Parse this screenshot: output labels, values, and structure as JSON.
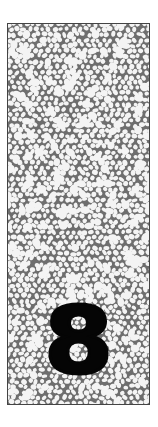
{
  "card": {
    "number": "8",
    "texture": "pebble-cells",
    "colors": {
      "cell_fill": "#f4f4f4",
      "cell_outline": "#6e6e6e",
      "border": "#444444",
      "number": "#050505",
      "page_background": "#ffffff"
    }
  }
}
